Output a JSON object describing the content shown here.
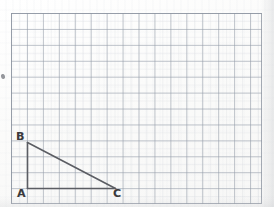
{
  "figure": {
    "background_color": "#fdfdfc",
    "grid": {
      "line_color": "#969eaa",
      "border_color": "#8c94a0",
      "cell_size_px": 16,
      "columns": 16,
      "rows": 12,
      "origin_x_px": 11,
      "origin_y_px": 13,
      "width_px": 251,
      "height_px": 191
    },
    "shape": {
      "type": "triangle",
      "name": "ABC",
      "stroke_color": "#5b5d63",
      "stroke_width_px": 1.6,
      "right_angle_at": "A",
      "vertices": [
        {
          "label": "A",
          "x": 27,
          "y": 188,
          "grid_col": 1,
          "grid_row": 11
        },
        {
          "label": "B",
          "x": 27,
          "y": 142,
          "grid_col": 1,
          "grid_row": 8
        },
        {
          "label": "C",
          "x": 115,
          "y": 188,
          "grid_col": 7,
          "grid_row": 11
        }
      ],
      "edges": [
        {
          "name": "AB",
          "from": "A",
          "to": "B",
          "length_cells": 3
        },
        {
          "name": "BC",
          "from": "B",
          "to": "C",
          "length_cells": 0
        },
        {
          "name": "CA",
          "from": "C",
          "to": "A",
          "length_cells": 6
        }
      ]
    },
    "labels": {
      "a": "A",
      "b": "B",
      "c": "C"
    },
    "annotations": {
      "stray_mark": "pencil-smudge"
    }
  },
  "chart_data": {
    "type": "scatter",
    "xlabel": "",
    "ylabel": "",
    "xlim": [
      0,
      16
    ],
    "ylim": [
      0,
      12
    ],
    "grid": true,
    "legend": "none",
    "series": [
      {
        "name": "Triangle ABC",
        "x": [
          1,
          1,
          7,
          1
        ],
        "y": [
          1,
          4,
          1,
          1
        ],
        "point_labels": [
          "A",
          "B",
          "C",
          "A"
        ]
      }
    ],
    "annotations": [
      {
        "text": "A",
        "x": 1,
        "y": 1
      },
      {
        "text": "B",
        "x": 1,
        "y": 4
      },
      {
        "text": "C",
        "x": 7,
        "y": 1
      }
    ]
  }
}
